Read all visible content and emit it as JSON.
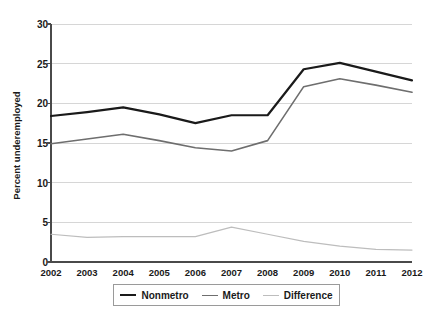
{
  "chart_data": {
    "type": "line",
    "title": "",
    "xlabel": "",
    "ylabel": "Percent underemployed",
    "x": [
      2002,
      2003,
      2004,
      2005,
      2006,
      2007,
      2008,
      2009,
      2010,
      2011,
      2012
    ],
    "xtick_labels": [
      "2002",
      "2003",
      "2004",
      "2005",
      "2006",
      "2007",
      "2008",
      "2009",
      "2010",
      "2011",
      "2012"
    ],
    "ytick_labels": [
      "0",
      "5",
      "10",
      "15",
      "20",
      "25",
      "30"
    ],
    "yticks": [
      0,
      5,
      10,
      15,
      20,
      25,
      30
    ],
    "ylim": [
      0,
      30
    ],
    "xlim": [
      2002,
      2012
    ],
    "grid": "horizontal",
    "legend_position": "bottom-center",
    "series": [
      {
        "name": "Nonmetro",
        "color": "#1a1a1a",
        "width": 2.2,
        "values": [
          18.4,
          18.9,
          19.5,
          18.6,
          17.5,
          18.5,
          18.5,
          24.3,
          25.1,
          24.0,
          22.9
        ]
      },
      {
        "name": "Metro",
        "color": "#6e6e6e",
        "width": 1.6,
        "values": [
          14.9,
          15.5,
          16.1,
          15.3,
          14.4,
          14.0,
          15.3,
          22.1,
          23.1,
          22.3,
          21.4
        ]
      },
      {
        "name": "Difference",
        "color": "#bdbdbd",
        "width": 1.2,
        "values": [
          3.5,
          3.1,
          3.2,
          3.2,
          3.2,
          4.4,
          3.5,
          2.6,
          2.0,
          1.6,
          1.5
        ]
      }
    ]
  },
  "legend": {
    "items": [
      {
        "label": "Nonmetro"
      },
      {
        "label": "Metro"
      },
      {
        "label": "Difference"
      }
    ]
  }
}
